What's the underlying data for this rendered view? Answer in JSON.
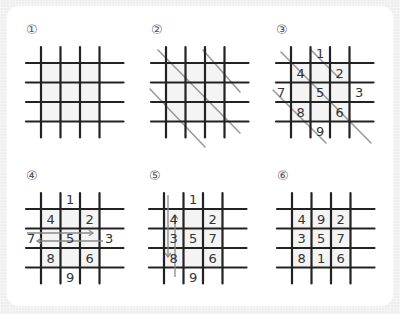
{
  "colors": {
    "grid_line": "#222222",
    "guide_line": "#9a9a9a",
    "digit": "#333333",
    "arrow": "#8a8a8a",
    "paper": "#ffffff",
    "background": "#eeeeee"
  },
  "panels": [
    {
      "step": "①",
      "description": "Draw a 4x4 line grid (# pattern)",
      "origin": [
        41,
        63
      ],
      "digits": [],
      "diagonals": [],
      "arrows": []
    },
    {
      "step": "②",
      "description": "Draw diagonal guide lines",
      "origin": [
        166,
        63
      ],
      "digits": [],
      "diagonals": [
        [
          -8,
          -13,
          74,
          70
        ],
        [
          37,
          -13,
          74,
          29
        ],
        [
          -16,
          26,
          39,
          84
        ]
      ],
      "arrows": []
    },
    {
      "step": "③",
      "description": "Write 1 to 9 along diagonals",
      "origin": [
        291,
        63
      ],
      "digits": [
        {
          "value": "1",
          "col": 1.5,
          "row": -0.5
        },
        {
          "value": "4",
          "col": 0.5,
          "row": 0.5
        },
        {
          "value": "2",
          "col": 2.5,
          "row": 0.5
        },
        {
          "value": "7",
          "col": -0.5,
          "row": 1.5
        },
        {
          "value": "5",
          "col": 1.5,
          "row": 1.5
        },
        {
          "value": "3",
          "col": 3.5,
          "row": 1.5
        },
        {
          "value": "8",
          "col": 0.5,
          "row": 2.5
        },
        {
          "value": "6",
          "col": 2.5,
          "row": 2.5
        },
        {
          "value": "9",
          "col": 1.5,
          "row": 3.5
        }
      ],
      "diagonals": [
        [
          -10,
          -11,
          80,
          80
        ],
        [
          20,
          -13,
          48,
          15
        ],
        [
          -18,
          27,
          35,
          80
        ]
      ],
      "arrows": []
    },
    {
      "step": "④",
      "description": "Move 7 and 3 across horizontally",
      "origin": [
        41,
        209
      ],
      "digits": [
        {
          "value": "1",
          "col": 1.5,
          "row": -0.5
        },
        {
          "value": "4",
          "col": 0.5,
          "row": 0.5
        },
        {
          "value": "2",
          "col": 2.5,
          "row": 0.5
        },
        {
          "value": "7",
          "col": -0.5,
          "row": 1.5
        },
        {
          "value": "5",
          "col": 1.5,
          "row": 1.5
        },
        {
          "value": "3",
          "col": 3.5,
          "row": 1.5
        },
        {
          "value": "8",
          "col": 0.5,
          "row": 2.5
        },
        {
          "value": "6",
          "col": 2.5,
          "row": 2.5
        },
        {
          "value": "9",
          "col": 1.5,
          "row": 3.5
        }
      ],
      "diagonals": [],
      "arrows": [
        {
          "from": [
            -14,
            24
          ],
          "to": [
            52,
            24
          ]
        },
        {
          "from": [
            62,
            32
          ],
          "to": [
            -4,
            32
          ]
        }
      ]
    },
    {
      "step": "⑤",
      "description": "Move 1 and 9 across vertically",
      "origin": [
        164,
        209
      ],
      "digits": [
        {
          "value": "1",
          "col": 1.5,
          "row": -0.5
        },
        {
          "value": "4",
          "col": 0.5,
          "row": 0.5
        },
        {
          "value": "2",
          "col": 2.5,
          "row": 0.5
        },
        {
          "value": "3",
          "col": 0.5,
          "row": 1.5
        },
        {
          "value": "5",
          "col": 1.5,
          "row": 1.5
        },
        {
          "value": "7",
          "col": 2.5,
          "row": 1.5
        },
        {
          "value": "8",
          "col": 0.5,
          "row": 2.5
        },
        {
          "value": "6",
          "col": 2.5,
          "row": 2.5
        },
        {
          "value": "9",
          "col": 1.5,
          "row": 3.5
        }
      ],
      "diagonals": [],
      "arrows": [
        {
          "from": [
            4,
            -14
          ],
          "to": [
            4,
            48
          ]
        },
        {
          "from": [
            11,
            68
          ],
          "to": [
            11,
            6
          ]
        }
      ]
    },
    {
      "step": "⑥",
      "description": "Completed 3x3 magic square",
      "origin": [
        292,
        209
      ],
      "digits": [
        {
          "value": "4",
          "col": 0.5,
          "row": 0.5
        },
        {
          "value": "9",
          "col": 1.5,
          "row": 0.5
        },
        {
          "value": "2",
          "col": 2.5,
          "row": 0.5
        },
        {
          "value": "3",
          "col": 0.5,
          "row": 1.5
        },
        {
          "value": "5",
          "col": 1.5,
          "row": 1.5
        },
        {
          "value": "7",
          "col": 2.5,
          "row": 1.5
        },
        {
          "value": "8",
          "col": 0.5,
          "row": 2.5
        },
        {
          "value": "1",
          "col": 1.5,
          "row": 2.5
        },
        {
          "value": "6",
          "col": 2.5,
          "row": 2.5
        }
      ],
      "diagonals": [],
      "arrows": []
    }
  ],
  "final_square": [
    [
      "4",
      "9",
      "2"
    ],
    [
      "3",
      "5",
      "7"
    ],
    [
      "8",
      "1",
      "6"
    ]
  ]
}
